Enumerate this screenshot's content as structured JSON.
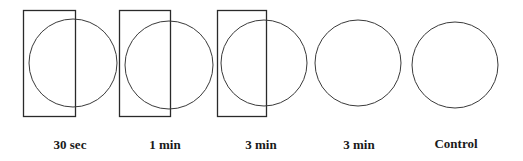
{
  "figure": {
    "panels": [
      {
        "label": "30 sec",
        "has_rectangle": true
      },
      {
        "label": "1 min",
        "has_rectangle": true
      },
      {
        "label": "3 min",
        "has_rectangle": true
      },
      {
        "label": "3 min",
        "has_rectangle": false
      },
      {
        "label": "Control",
        "has_rectangle": false
      }
    ]
  }
}
